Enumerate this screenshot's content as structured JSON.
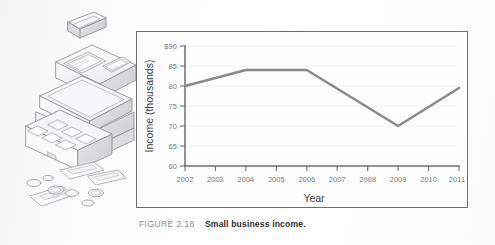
{
  "figure": {
    "label": "FIGURE 2.18",
    "caption": "Small business income.",
    "illustration_name": "cash-register-with-money"
  },
  "chart_data": {
    "type": "line",
    "title": "",
    "xlabel": "Year",
    "ylabel": "Income (thousands)",
    "categories": [
      "2002",
      "2003",
      "2004",
      "2005",
      "2006",
      "2007",
      "2008",
      "2009",
      "2010",
      "2011"
    ],
    "x": [
      2002,
      2003,
      2004,
      2005,
      2006,
      2007,
      2008,
      2009,
      2010,
      2011
    ],
    "values": [
      80,
      82,
      84,
      84,
      84,
      79.3,
      74.7,
      70,
      74.8,
      79.5
    ],
    "vertices": [
      {
        "x": 2002,
        "y": 80
      },
      {
        "x": 2004,
        "y": 84
      },
      {
        "x": 2006,
        "y": 84
      },
      {
        "x": 2009,
        "y": 70
      },
      {
        "x": 2011,
        "y": 79.5
      }
    ],
    "ylim": [
      60,
      90
    ],
    "xlim": [
      2002,
      2011
    ],
    "yticks": [
      60,
      65,
      70,
      75,
      80,
      85,
      90
    ],
    "ytick_labels": [
      "60",
      "65",
      "70",
      "75",
      "80",
      "85",
      "$90"
    ],
    "xticks": [
      2002,
      2003,
      2004,
      2005,
      2006,
      2007,
      2008,
      2009,
      2010,
      2011
    ],
    "xtick_labels": [
      "2002",
      "2003",
      "2004",
      "2005",
      "2006",
      "2007",
      "2008",
      "2009",
      "2010",
      "2011"
    ],
    "grid": true,
    "grid_axis": "y",
    "legend": false,
    "line_color": "#8a8a8e",
    "axis_color": "#6e6e72",
    "grid_color": "#ececee"
  }
}
